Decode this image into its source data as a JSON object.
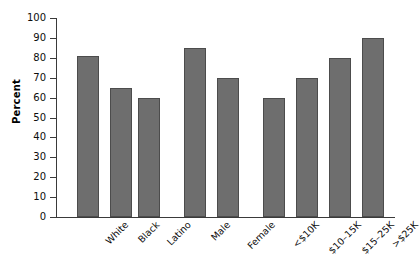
{
  "chart_data": {
    "type": "bar",
    "title": "",
    "xlabel": "",
    "ylabel": "Percent",
    "ylim": [
      0,
      100
    ],
    "ytick_labels": [
      "0",
      "10",
      "20",
      "30",
      "40",
      "50",
      "60",
      "70",
      "80",
      "90",
      "100"
    ],
    "ytick_values": [
      0,
      10,
      20,
      30,
      40,
      50,
      60,
      70,
      80,
      90,
      100
    ],
    "grid": false,
    "legend": null,
    "bar_color": "#6e6e6e",
    "bar_border_color": "#4c4c4c",
    "axis_color": "#3a3a3a",
    "categories": [
      "White",
      "Black",
      "Latino",
      "Male",
      "Female",
      "<$10K",
      "$10–15K",
      "$15–25K",
      ">$25K"
    ],
    "values": [
      81,
      65,
      60,
      85,
      70,
      60,
      70,
      80,
      90
    ],
    "groups": [
      {
        "name": "race",
        "categories": [
          "White",
          "Black",
          "Latino"
        ],
        "values": [
          81,
          65,
          60
        ]
      },
      {
        "name": "sex",
        "categories": [
          "Male",
          "Female"
        ],
        "values": [
          85,
          70
        ]
      },
      {
        "name": "income",
        "categories": [
          "<$10K",
          "$10–15K",
          "$15–25K",
          ">$25K"
        ],
        "values": [
          60,
          70,
          80,
          90
        ]
      }
    ],
    "bars": [
      {
        "label": "White",
        "value": 81,
        "x": 21,
        "width": 22
      },
      {
        "label": "Black",
        "value": 65,
        "x": 54,
        "width": 22
      },
      {
        "label": "Latino",
        "value": 60,
        "x": 82,
        "width": 22
      },
      {
        "label": "Male",
        "value": 85,
        "x": 128,
        "width": 22
      },
      {
        "label": "Female",
        "value": 70,
        "x": 161,
        "width": 22
      },
      {
        "label": "<$10K",
        "value": 60,
        "x": 207,
        "width": 22
      },
      {
        "label": "$10–15K",
        "value": 70,
        "x": 240,
        "width": 22
      },
      {
        "label": "$15–25K",
        "value": 80,
        "x": 273,
        "width": 22
      },
      {
        "label": ">$25K",
        "value": 90,
        "x": 306,
        "width": 22
      }
    ]
  }
}
